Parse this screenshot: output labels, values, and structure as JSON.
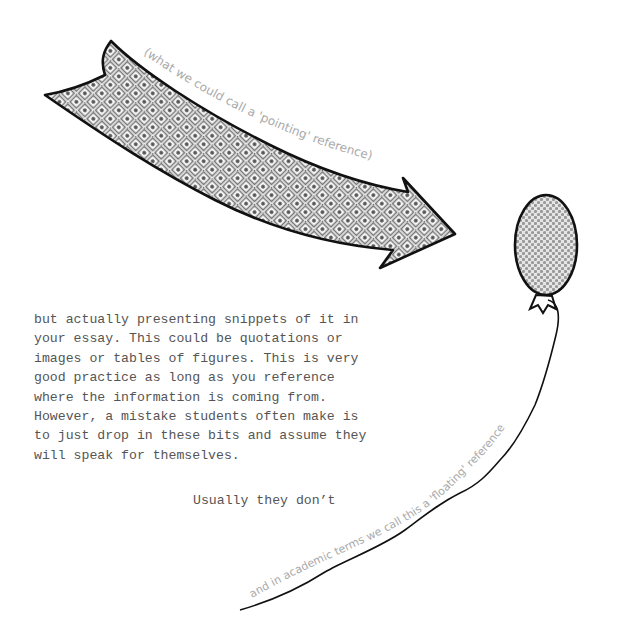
{
  "arrow": {
    "caption": "(what we could call a 'pointing' reference)"
  },
  "balloon": {
    "caption": "and in academic terms we call this a 'floating' reference"
  },
  "body": {
    "lines": [
      "but actually presenting snippets of it in",
      "your essay. This could be quotations or",
      "images or tables of figures. This is very",
      "good practice as long as you reference",
      "where the information is coming from.",
      "However, a mistake students often make is",
      "to just drop in these bits and assume they",
      "will speak for themselves."
    ],
    "closing": "Usually they don’t"
  },
  "colors": {
    "ink": "#111111",
    "text": "#555555",
    "caption": "#a9a9a9",
    "pattern": "#8a8a8a"
  }
}
